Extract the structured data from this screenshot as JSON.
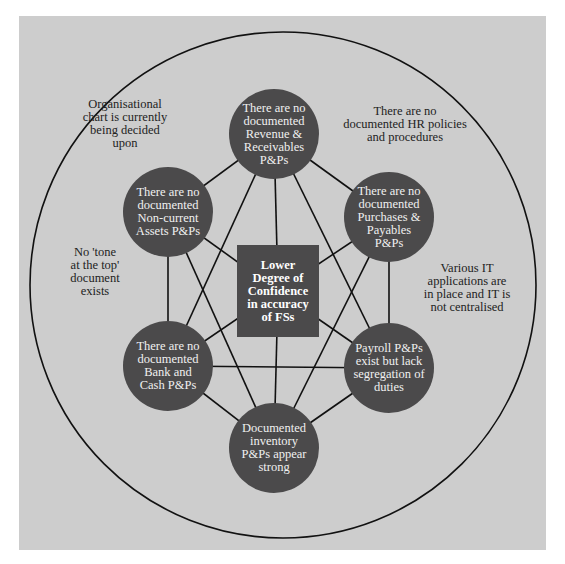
{
  "colors": {
    "background": "#cdcdcd",
    "node_fill": "#4b4a4b",
    "line": "#111111",
    "node_text": "#f0f0f0",
    "note_text": "#222222"
  },
  "center": {
    "id": "center",
    "label": "Lower\nDegree of\nConfidence\nin accuracy\nof FSs"
  },
  "nodes": [
    {
      "id": "revenue",
      "label": "There are no\ndocumented\nRevenue &\nReceivables\nP&Ps"
    },
    {
      "id": "non_current",
      "label": "There are no\ndocumented\nNon-current\nAssets P&Ps"
    },
    {
      "id": "purchases",
      "label": "There are no\ndocumented\nPurchases &\nPayables\nP&Ps"
    },
    {
      "id": "bank_cash",
      "label": "There are no\ndocumented\nBank and\nCash P&Ps"
    },
    {
      "id": "payroll",
      "label": "Payroll P&Ps\nexist but lack\nsegregation of\nduties"
    },
    {
      "id": "inventory",
      "label": "Documented\ninventory\nP&Ps appear\nstrong"
    }
  ],
  "edges": [
    [
      "revenue",
      "non_current"
    ],
    [
      "revenue",
      "purchases"
    ],
    [
      "revenue",
      "center"
    ],
    [
      "revenue",
      "bank_cash"
    ],
    [
      "revenue",
      "payroll"
    ],
    [
      "non_current",
      "bank_cash"
    ],
    [
      "non_current",
      "center"
    ],
    [
      "non_current",
      "inventory"
    ],
    [
      "purchases",
      "payroll"
    ],
    [
      "purchases",
      "center"
    ],
    [
      "purchases",
      "inventory"
    ],
    [
      "bank_cash",
      "payroll"
    ],
    [
      "bank_cash",
      "center"
    ],
    [
      "bank_cash",
      "inventory"
    ],
    [
      "payroll",
      "center"
    ],
    [
      "payroll",
      "inventory"
    ],
    [
      "center",
      "inventory"
    ]
  ],
  "notes": [
    {
      "id": "org_chart",
      "text": "Organisational\nchart is currently\nbeing decided\nupon"
    },
    {
      "id": "hr_policies",
      "text": "There are no\ndocumented HR policies\nand procedures"
    },
    {
      "id": "tone_at_top",
      "text": "No 'tone\nat the top'\ndocument\nexists"
    },
    {
      "id": "it_apps",
      "text": "Various IT\napplications are\nin place and IT is\nnot centralised"
    }
  ]
}
